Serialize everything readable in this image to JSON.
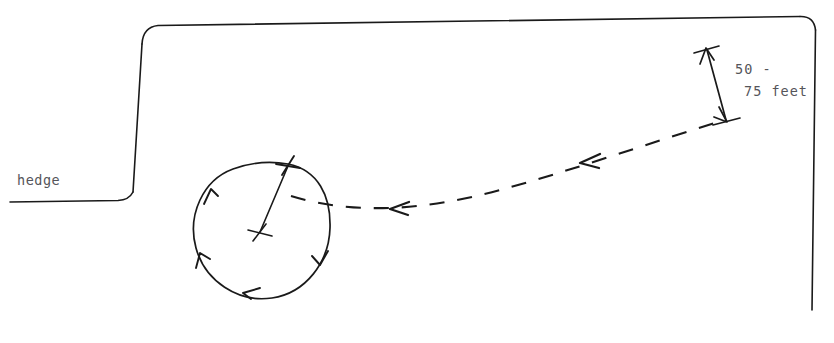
{
  "diagram": {
    "type": "hand-drawn-technical-sketch",
    "background_color": "#ffffff",
    "ink_color": "#1a1a1a",
    "text_color": "#55555a",
    "labels": {
      "hedge": "hedge",
      "distance_line_1": "50 -",
      "distance_line_2": "75 feet"
    },
    "features": {
      "hedge_boundary": {
        "name": "hedge-boundary-line",
        "description": "solid line forming left horizontal run, rising slanted vertical, long top horizontal, and right descending vertical",
        "stroke_width": 1.6
      },
      "circle_path": {
        "name": "circling-flight-path",
        "center_x": 262,
        "center_y": 230,
        "radius": 68,
        "direction": "counterclockwise",
        "arrow_count": 4
      },
      "radius_line": {
        "name": "radius-line",
        "from_x": 260,
        "from_y": 233,
        "to_x": 288,
        "to_y": 165
      },
      "approach_path": {
        "name": "dashed-approach-path",
        "style": "dashed",
        "direction": "right-to-left",
        "arrow_count": 2
      },
      "dimension_arrow": {
        "name": "dimension-arrow",
        "top_x": 706,
        "top_y": 48,
        "bottom_x": 727,
        "bottom_y": 122,
        "heads": "double"
      },
      "cross_marks": [
        {
          "name": "circle-center-mark",
          "x": 260,
          "y": 233
        },
        {
          "name": "circle-entry-mark",
          "x": 288,
          "y": 165
        },
        {
          "name": "dimension-top-mark",
          "x": 706,
          "y": 48
        },
        {
          "name": "dimension-bottom-mark",
          "x": 727,
          "y": 122
        }
      ]
    }
  }
}
